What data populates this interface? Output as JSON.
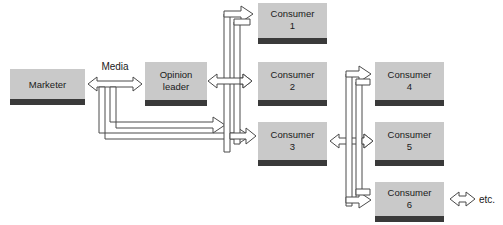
{
  "diagram": {
    "nodes": [
      {
        "id": "marketer",
        "label_line1": "Marketer",
        "label_line2": "",
        "x": 10,
        "y": 69,
        "w": 75,
        "h": 30,
        "bar_h": 6
      },
      {
        "id": "opinion-leader",
        "label_line1": "Opinion",
        "label_line2": "leader",
        "x": 145,
        "y": 62,
        "w": 62,
        "h": 38,
        "bar_h": 6
      },
      {
        "id": "consumer-1",
        "label_line1": "Consumer",
        "label_line2": "1",
        "x": 258,
        "y": 3,
        "w": 69,
        "h": 35,
        "bar_h": 6
      },
      {
        "id": "consumer-2",
        "label_line1": "Consumer",
        "label_line2": "2",
        "x": 258,
        "y": 62,
        "w": 69,
        "h": 38,
        "bar_h": 6
      },
      {
        "id": "consumer-3",
        "label_line1": "Consumer",
        "label_line2": "3",
        "x": 258,
        "y": 122,
        "w": 69,
        "h": 38,
        "bar_h": 6
      },
      {
        "id": "consumer-4",
        "label_line1": "Consumer",
        "label_line2": "4",
        "x": 375,
        "y": 62,
        "w": 69,
        "h": 38,
        "bar_h": 6
      },
      {
        "id": "consumer-5",
        "label_line1": "Consumer",
        "label_line2": "5",
        "x": 375,
        "y": 122,
        "w": 69,
        "h": 38,
        "bar_h": 6
      },
      {
        "id": "consumer-6",
        "label_line1": "Consumer",
        "label_line2": "6",
        "x": 375,
        "y": 182,
        "w": 69,
        "h": 34,
        "bar_h": 6
      }
    ],
    "annotations": {
      "media_label": "Media",
      "etc_label": "etc."
    },
    "colors": {
      "box_fill": "#c9c9c9",
      "box_bar": "#3a3a3a",
      "arrow_fill": "#ffffff",
      "arrow_stroke": "#4a4a4a",
      "text": "#1a1a1a",
      "background": "#ffffff"
    },
    "edges": [
      {
        "id": "marketer-opinion-leader",
        "from": "marketer",
        "to": "opinion-leader",
        "kind": "double-arrow",
        "label": "Media"
      },
      {
        "id": "marketer-consumer-3",
        "from": "marketer",
        "to": "consumer-3",
        "kind": "arrow",
        "label": ""
      },
      {
        "id": "opinion-leader-consumer-1",
        "from": "opinion-leader",
        "to": "consumer-1",
        "kind": "arrow",
        "label": ""
      },
      {
        "id": "opinion-leader-consumer-2",
        "from": "opinion-leader",
        "to": "consumer-2",
        "kind": "double-arrow",
        "label": ""
      },
      {
        "id": "opinion-leader-consumer-3",
        "from": "opinion-leader",
        "to": "consumer-3",
        "kind": "arrow",
        "label": ""
      },
      {
        "id": "consumer-3-consumer-4",
        "from": "consumer-3",
        "to": "consumer-4",
        "kind": "arrow",
        "label": ""
      },
      {
        "id": "consumer-3-consumer-5",
        "from": "consumer-3",
        "to": "consumer-5",
        "kind": "double-arrow",
        "label": ""
      },
      {
        "id": "consumer-3-consumer-6",
        "from": "consumer-3",
        "to": "consumer-6",
        "kind": "arrow",
        "label": ""
      },
      {
        "id": "consumer-6-etc",
        "from": "consumer-6",
        "to": "etc",
        "kind": "double-arrow",
        "label": "etc."
      }
    ]
  }
}
